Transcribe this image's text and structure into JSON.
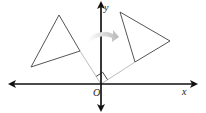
{
  "diagram": {
    "type": "rotation about origin",
    "labels": {
      "x_axis": "x",
      "y_axis": "y",
      "origin": "O"
    },
    "colors": {
      "axes": "#111111",
      "triangle": "#555555",
      "guide_line": "#aaaaaa",
      "arrow": "#c8c8c8"
    },
    "preimage_triangle": {
      "vertices": [
        [
          59,
          15
        ],
        [
          31,
          67
        ],
        [
          80,
          51
        ]
      ]
    },
    "image_triangle": {
      "vertices": [
        [
          120,
          12
        ],
        [
          170,
          41
        ],
        [
          135,
          62
        ]
      ]
    },
    "rotation_arrow": {
      "direction": "clockwise",
      "angle_marker": "right angle"
    }
  }
}
